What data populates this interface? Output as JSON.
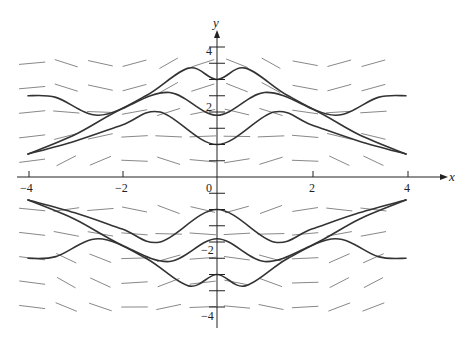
{
  "chart_data": {
    "type": "line",
    "title": "",
    "subtitle": "",
    "xlabel": "x",
    "ylabel": "y",
    "xlim": [
      -4,
      4
    ],
    "ylim": [
      -4,
      4
    ],
    "x_ticks": [
      -4,
      -2,
      0,
      2,
      4
    ],
    "x_tick_labels": [
      "-4",
      "-2",
      "0",
      "2",
      "4"
    ],
    "y_ticks": [
      -4,
      -3.5,
      -3,
      -2.5,
      -2,
      -1.5,
      -1,
      -0.5,
      0.5,
      1,
      1.5,
      2,
      2.5,
      3,
      3.5,
      4
    ],
    "y_tick_labels": [
      "-4",
      "-2",
      "2",
      "4"
    ],
    "grid": false,
    "legend": null,
    "series": [
      {
        "name": "curve-top",
        "points": [
          [
            -4,
            2.5
          ],
          [
            -3.4,
            2.45
          ],
          [
            -2.5,
            1.9
          ],
          [
            -1.5,
            2.5
          ],
          [
            -0.6,
            3.35
          ],
          [
            0,
            3.0
          ],
          [
            0.6,
            3.35
          ],
          [
            1.5,
            2.5
          ],
          [
            2.5,
            1.9
          ],
          [
            3.4,
            2.45
          ],
          [
            4,
            2.5
          ]
        ]
      },
      {
        "name": "curve-mid-upper",
        "points": [
          [
            -4,
            0.7
          ],
          [
            -3,
            1.3
          ],
          [
            -2,
            2.1
          ],
          [
            -1,
            2.6
          ],
          [
            0,
            1.9
          ],
          [
            1,
            2.6
          ],
          [
            2,
            2.1
          ],
          [
            3,
            1.3
          ],
          [
            4,
            0.7
          ]
        ]
      },
      {
        "name": "curve-low-upper",
        "points": [
          [
            -4,
            0.7
          ],
          [
            -3,
            1.1
          ],
          [
            -2,
            1.6
          ],
          [
            -1.2,
            2.0
          ],
          [
            0,
            1.0
          ],
          [
            1.2,
            2.0
          ],
          [
            2,
            1.6
          ],
          [
            3,
            1.1
          ],
          [
            4,
            0.7
          ]
        ]
      },
      {
        "name": "curve-high-lower",
        "points": [
          [
            -4,
            -0.7
          ],
          [
            -3,
            -1.1
          ],
          [
            -2,
            -1.6
          ],
          [
            -1.2,
            -2.0
          ],
          [
            0,
            -1.0
          ],
          [
            1.2,
            -2.0
          ],
          [
            2,
            -1.6
          ],
          [
            3,
            -1.1
          ],
          [
            4,
            -0.7
          ]
        ]
      },
      {
        "name": "curve-mid-lower",
        "points": [
          [
            -4,
            -0.7
          ],
          [
            -3,
            -1.3
          ],
          [
            -2,
            -2.1
          ],
          [
            -1,
            -2.6
          ],
          [
            0,
            -1.9
          ],
          [
            1,
            -2.6
          ],
          [
            2,
            -2.1
          ],
          [
            3,
            -1.3
          ],
          [
            4,
            -0.7
          ]
        ]
      },
      {
        "name": "curve-bottom",
        "points": [
          [
            -4,
            -2.5
          ],
          [
            -3.4,
            -2.45
          ],
          [
            -2.5,
            -1.9
          ],
          [
            -1.5,
            -2.5
          ],
          [
            -0.6,
            -3.35
          ],
          [
            0,
            -3.0
          ],
          [
            0.6,
            -3.35
          ],
          [
            1.5,
            -2.5
          ],
          [
            2.5,
            -1.9
          ],
          [
            3.4,
            -2.45
          ],
          [
            4,
            -2.5
          ]
        ]
      }
    ]
  },
  "axes": {
    "x_label": "x",
    "y_label": "y",
    "x_tick_labels": [
      "-4",
      "-2",
      "0",
      "2",
      "4"
    ],
    "y_tick_labels": [
      "4",
      "2",
      "-2",
      "-4"
    ]
  },
  "colors": {
    "curve": "#333333",
    "field": "#777777",
    "axis": "#222222"
  }
}
